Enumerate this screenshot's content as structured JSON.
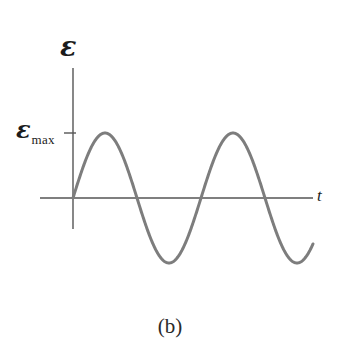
{
  "figure": {
    "caption": "(b)",
    "background_color": "#ffffff"
  },
  "axes": {
    "y_axis_label": "ε",
    "x_axis_label": "t",
    "tick_label_symbol": "ε",
    "tick_label_subscript": "max",
    "axis_color": "#555555",
    "axis_origin_px": {
      "x": 73,
      "y": 198
    },
    "y_axis_top_px": 68,
    "y_axis_bottom_px": 229,
    "x_axis_left_px": 40,
    "x_axis_right_px": 313,
    "tick_y_px": 133,
    "tick_length_px": 10
  },
  "chart_data": {
    "type": "line",
    "title": "",
    "subtitle": "",
    "xlabel": "t",
    "ylabel": "ε",
    "grid": false,
    "legend": null,
    "curve_color": "#7d7d7d",
    "curve_width_px": 3,
    "waveform": {
      "function": "emf = emf_max * sin(2*pi*t/T)",
      "amplitude_label": "εmax",
      "amplitude_px": 65,
      "period_px": 128,
      "start_px": 73,
      "end_px": 313,
      "cycles": 1.875,
      "phase": "starts at origin rising"
    },
    "annotations": [
      {
        "label": "εmax",
        "type": "y-tick",
        "y_px": 133
      },
      {
        "label": "t",
        "type": "axis-label"
      },
      {
        "label": "ε",
        "type": "axis-label"
      }
    ],
    "x": [
      73,
      81,
      89,
      97,
      105,
      113,
      121,
      129,
      137,
      145,
      153,
      161,
      169,
      177,
      185,
      193,
      201,
      209,
      217,
      225,
      233,
      241,
      249,
      257,
      265,
      273,
      281,
      289,
      297,
      305,
      313
    ],
    "y": [
      0,
      24.9,
      45.9,
      60.1,
      65,
      60.1,
      45.9,
      24.9,
      0,
      -24.9,
      -45.9,
      -60.1,
      -65,
      -60.1,
      -45.9,
      -24.9,
      0,
      24.9,
      45.9,
      60.1,
      65,
      60.1,
      45.9,
      24.9,
      0,
      -24.9,
      -45.9,
      -60.1,
      -65,
      -60.1,
      -36
    ],
    "ylim": [
      -70,
      70
    ],
    "key_points": {
      "peaks_px_x": [
        105,
        220
      ],
      "troughs_px_x": [
        169,
        283
      ],
      "zero_crossings_px_x": [
        73,
        137,
        201,
        265
      ],
      "peak_px_y": 133,
      "trough_px_y": 265
    }
  }
}
